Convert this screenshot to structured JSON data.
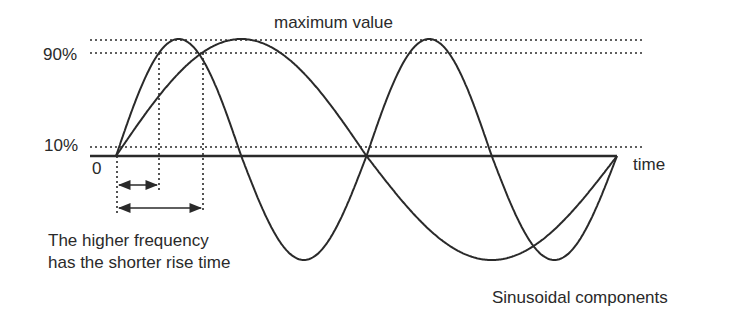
{
  "diagram": {
    "title": "maximum value",
    "y_labels": {
      "ninety": "90%",
      "ten": "10%",
      "zero": "0"
    },
    "x_axis_label": "time",
    "caption_lines": [
      "The higher frequency",
      "has the shorter rise time"
    ],
    "footer": "Sinusoidal components",
    "colors": {
      "stroke": "#2a2a2a",
      "background": "#ffffff"
    },
    "curves": [
      {
        "name": "higher-frequency sinusoid",
        "cycles": 2,
        "rise_time_10_90": "short"
      },
      {
        "name": "lower-frequency sinusoid",
        "cycles": 1,
        "rise_time_10_90": "long"
      }
    ],
    "annotations": [
      {
        "type": "dimension-arrow",
        "meaning": "rise time of higher frequency (10%→90%)"
      },
      {
        "type": "dimension-arrow",
        "meaning": "rise time of lower frequency (10%→90%)"
      }
    ]
  }
}
